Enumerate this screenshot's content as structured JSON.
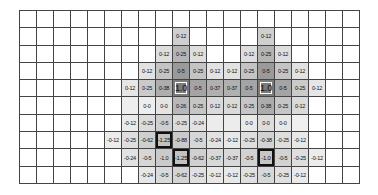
{
  "grid": {
    "columns": 20,
    "rows": 10,
    "cells": [
      {
        "r": 1,
        "c": 9,
        "v": "0-12",
        "shade": "#cfcfcf"
      },
      {
        "r": 1,
        "c": 14,
        "v": "0-12",
        "shade": "#cfcfcf"
      },
      {
        "r": 2,
        "c": 8,
        "v": "0-12",
        "shade": "#dedede"
      },
      {
        "r": 2,
        "c": 9,
        "v": "0-25",
        "shade": "#b4b4b4"
      },
      {
        "r": 2,
        "c": 10,
        "v": "0-12",
        "shade": "#dedede"
      },
      {
        "r": 2,
        "c": 13,
        "v": "0-12",
        "shade": "#dedede"
      },
      {
        "r": 2,
        "c": 14,
        "v": "0-25",
        "shade": "#b4b4b4"
      },
      {
        "r": 2,
        "c": 15,
        "v": "0-12",
        "shade": "#dedede"
      },
      {
        "r": 3,
        "c": 7,
        "v": "0-12",
        "shade": "#e2e2e2"
      },
      {
        "r": 3,
        "c": 8,
        "v": "0-25",
        "shade": "#c4c4c4"
      },
      {
        "r": 3,
        "c": 9,
        "v": "0-5",
        "shade": "#9a9a9a"
      },
      {
        "r": 3,
        "c": 10,
        "v": "0-25",
        "shade": "#c4c4c4"
      },
      {
        "r": 3,
        "c": 11,
        "v": "0-12",
        "shade": "#e2e2e2"
      },
      {
        "r": 3,
        "c": 12,
        "v": "0-12",
        "shade": "#e2e2e2"
      },
      {
        "r": 3,
        "c": 13,
        "v": "0-25",
        "shade": "#c4c4c4"
      },
      {
        "r": 3,
        "c": 14,
        "v": "0-5",
        "shade": "#9a9a9a"
      },
      {
        "r": 3,
        "c": 15,
        "v": "0-25",
        "shade": "#c4c4c4"
      },
      {
        "r": 3,
        "c": 16,
        "v": "0-12",
        "shade": "#e2e2e2"
      },
      {
        "r": 4,
        "c": 6,
        "v": "0-12",
        "shade": "#e6e6e6"
      },
      {
        "r": 4,
        "c": 7,
        "v": "0-25",
        "shade": "#cacaca"
      },
      {
        "r": 4,
        "c": 8,
        "v": "0-38",
        "shade": "#adadad"
      },
      {
        "r": 4,
        "c": 9,
        "v": "1.0",
        "shade": "#7a7a7a",
        "type": "peak"
      },
      {
        "r": 4,
        "c": 10,
        "v": "0-5",
        "shade": "#a4a4a4"
      },
      {
        "r": 4,
        "c": 11,
        "v": "0-37",
        "shade": "#b0b0b0"
      },
      {
        "r": 4,
        "c": 12,
        "v": "0-37",
        "shade": "#b0b0b0"
      },
      {
        "r": 4,
        "c": 13,
        "v": "0-5",
        "shade": "#a4a4a4"
      },
      {
        "r": 4,
        "c": 14,
        "v": "1.0",
        "shade": "#7a7a7a",
        "type": "peak"
      },
      {
        "r": 4,
        "c": 15,
        "v": "0-5",
        "shade": "#a4a4a4"
      },
      {
        "r": 4,
        "c": 16,
        "v": "0-25",
        "shade": "#cacaca"
      },
      {
        "r": 4,
        "c": 17,
        "v": "0-12",
        "shade": "#e6e6e6"
      },
      {
        "r": 5,
        "c": 6,
        "v": "",
        "shade": "#eeeeee"
      },
      {
        "r": 5,
        "c": 7,
        "v": "0-0",
        "shade": "#eeeeee"
      },
      {
        "r": 5,
        "c": 8,
        "v": "0-0",
        "shade": "#e4e4e4"
      },
      {
        "r": 5,
        "c": 9,
        "v": "0-26",
        "shade": "#b8b8b8"
      },
      {
        "r": 5,
        "c": 10,
        "v": "0-25",
        "shade": "#c6c6c6"
      },
      {
        "r": 5,
        "c": 11,
        "v": "0-12",
        "shade": "#dadada"
      },
      {
        "r": 5,
        "c": 12,
        "v": "0-12",
        "shade": "#dadada"
      },
      {
        "r": 5,
        "c": 13,
        "v": "0-25",
        "shade": "#c6c6c6"
      },
      {
        "r": 5,
        "c": 14,
        "v": "0-38",
        "shade": "#acacac"
      },
      {
        "r": 5,
        "c": 15,
        "v": "0-25",
        "shade": "#c6c6c6"
      },
      {
        "r": 5,
        "c": 16,
        "v": "0-12",
        "shade": "#dadada"
      },
      {
        "r": 6,
        "c": 6,
        "v": "-0-12",
        "shade": "#eaeaea"
      },
      {
        "r": 6,
        "c": 7,
        "v": "-0-25",
        "shade": "#dcdcdc"
      },
      {
        "r": 6,
        "c": 8,
        "v": "-0-5",
        "shade": "#cecece"
      },
      {
        "r": 6,
        "c": 9,
        "v": "-0-25",
        "shade": "#dcdcdc"
      },
      {
        "r": 6,
        "c": 10,
        "v": "-0-24",
        "shade": "#e2e2e2"
      },
      {
        "r": 6,
        "c": 11,
        "v": "",
        "shade": "#ececec"
      },
      {
        "r": 6,
        "c": 12,
        "v": "",
        "shade": "#ececec"
      },
      {
        "r": 6,
        "c": 13,
        "v": "0-0",
        "shade": "#e8e8e8"
      },
      {
        "r": 6,
        "c": 14,
        "v": "0-0",
        "shade": "#dcdcdc"
      },
      {
        "r": 6,
        "c": 15,
        "v": "0-0",
        "shade": "#e8e8e8"
      },
      {
        "r": 6,
        "c": 16,
        "v": "",
        "shade": "#f0f0f0"
      },
      {
        "r": 7,
        "c": 5,
        "v": "-0-12",
        "shade": "#ececec"
      },
      {
        "r": 7,
        "c": 6,
        "v": "-0-25",
        "shade": "#dedede"
      },
      {
        "r": 7,
        "c": 7,
        "v": "-0-62",
        "shade": "#cfcfcf"
      },
      {
        "r": 7,
        "c": 8,
        "v": "-1.25",
        "shade": "#c2c2c2",
        "type": "trough"
      },
      {
        "r": 7,
        "c": 9,
        "v": "-0-88",
        "shade": "#cacaca"
      },
      {
        "r": 7,
        "c": 10,
        "v": "-0-5",
        "shade": "#d6d6d6"
      },
      {
        "r": 7,
        "c": 11,
        "v": "-0-24",
        "shade": "#e2e2e2"
      },
      {
        "r": 7,
        "c": 12,
        "v": "-0-12",
        "shade": "#e8e8e8"
      },
      {
        "r": 7,
        "c": 13,
        "v": "-0-25",
        "shade": "#dedede"
      },
      {
        "r": 7,
        "c": 14,
        "v": "-0-38",
        "shade": "#d2d2d2"
      },
      {
        "r": 7,
        "c": 15,
        "v": "-0-25",
        "shade": "#dedede"
      },
      {
        "r": 7,
        "c": 16,
        "v": "-0-12",
        "shade": "#e8e8e8"
      },
      {
        "r": 8,
        "c": 6,
        "v": "-0-24",
        "shade": "#e2e2e2"
      },
      {
        "r": 8,
        "c": 7,
        "v": "-0-5",
        "shade": "#d6d6d6"
      },
      {
        "r": 8,
        "c": 8,
        "v": "-1.0",
        "shade": "#cacaca"
      },
      {
        "r": 8,
        "c": 9,
        "v": "-1.25",
        "shade": "#c2c2c2",
        "type": "trough"
      },
      {
        "r": 8,
        "c": 10,
        "v": "-0-62",
        "shade": "#d0d0d0"
      },
      {
        "r": 8,
        "c": 11,
        "v": "-0-37",
        "shade": "#d8d8d8"
      },
      {
        "r": 8,
        "c": 12,
        "v": "-0-37",
        "shade": "#d8d8d8"
      },
      {
        "r": 8,
        "c": 13,
        "v": "-0-5",
        "shade": "#d2d2d2"
      },
      {
        "r": 8,
        "c": 14,
        "v": "-1.0",
        "shade": "#c6c6c6",
        "type": "trough"
      },
      {
        "r": 8,
        "c": 15,
        "v": "-0-5",
        "shade": "#d2d2d2"
      },
      {
        "r": 8,
        "c": 16,
        "v": "-0-25",
        "shade": "#dedede"
      },
      {
        "r": 8,
        "c": 17,
        "v": "-0-12",
        "shade": "#ececec"
      },
      {
        "r": 9,
        "c": 7,
        "v": "-0-24",
        "shade": "#e6e6e6"
      },
      {
        "r": 9,
        "c": 8,
        "v": "-0-5",
        "shade": "#dadada"
      },
      {
        "r": 9,
        "c": 9,
        "v": "-0-62",
        "shade": "#d4d4d4"
      },
      {
        "r": 9,
        "c": 10,
        "v": "-0-25",
        "shade": "#e0e0e0"
      },
      {
        "r": 9,
        "c": 11,
        "v": "-0-12",
        "shade": "#e8e8e8"
      },
      {
        "r": 9,
        "c": 12,
        "v": "-0-12",
        "shade": "#e8e8e8"
      },
      {
        "r": 9,
        "c": 13,
        "v": "-0-25",
        "shade": "#e0e0e0"
      },
      {
        "r": 9,
        "c": 14,
        "v": "-0-5",
        "shade": "#d8d8d8"
      },
      {
        "r": 9,
        "c": 15,
        "v": "-0-25",
        "shade": "#e0e0e0"
      },
      {
        "r": 9,
        "c": 16,
        "v": "-0-12",
        "shade": "#eaeaea"
      }
    ]
  }
}
